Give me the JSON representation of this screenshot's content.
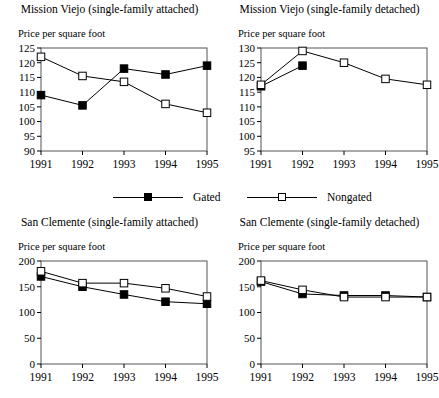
{
  "legend": {
    "gated_label": "Gated",
    "nongated_label": "Nongated",
    "gated_marker": "filled-square-marker",
    "nongated_marker": "open-square-marker"
  },
  "panels": [
    {
      "id": "mission-viejo-attached",
      "title": "Mission Viejo (single-family attached)",
      "ylabel": "Price per square foot"
    },
    {
      "id": "mission-viejo-detached",
      "title": "Mission Viejo (single-family detached)",
      "ylabel": "Price per square foot"
    },
    {
      "id": "san-clemente-attached",
      "title": "San Clemente (single-family attached)",
      "ylabel": "Price per square foot"
    },
    {
      "id": "san-clemente-detached",
      "title": "San Clemente (single-family detached)",
      "ylabel": "Price per square foot"
    }
  ],
  "chart_data": [
    {
      "type": "line",
      "title": "Mission Viejo (single-family attached)",
      "xlabel": "",
      "ylabel": "Price per square foot",
      "categories": [
        "1991",
        "1992",
        "1993",
        "1994",
        "1995"
      ],
      "x": [
        1991,
        1992,
        1993,
        1994,
        1995
      ],
      "ylim": [
        90,
        125
      ],
      "yticks": [
        90,
        95,
        100,
        105,
        110,
        115,
        120,
        125
      ],
      "grid": false,
      "legend_position": "below-figure",
      "series": [
        {
          "name": "Gated",
          "marker": "filled-square",
          "values": [
            109,
            105.5,
            118,
            116,
            119
          ]
        },
        {
          "name": "Nongated",
          "marker": "open-square",
          "values": [
            122,
            115.5,
            113.5,
            106,
            103
          ]
        }
      ]
    },
    {
      "type": "line",
      "title": "Mission Viejo (single-family detached)",
      "xlabel": "",
      "ylabel": "Price per square foot",
      "categories": [
        "1991",
        "1992",
        "1993",
        "1994",
        "1995"
      ],
      "x": [
        1991,
        1992,
        1993,
        1994,
        1995
      ],
      "ylim": [
        95,
        130
      ],
      "yticks": [
        95,
        100,
        105,
        110,
        115,
        120,
        125,
        130
      ],
      "grid": false,
      "legend_position": "below-figure",
      "series": [
        {
          "name": "Gated",
          "marker": "filled-square",
          "values": [
            117,
            124,
            null,
            null,
            null
          ]
        },
        {
          "name": "Nongated",
          "marker": "open-square",
          "values": [
            117.5,
            129,
            125,
            119.5,
            117.5
          ]
        }
      ]
    },
    {
      "type": "line",
      "title": "San Clemente (single-family attached)",
      "xlabel": "",
      "ylabel": "Price per square foot",
      "categories": [
        "1991",
        "1992",
        "1993",
        "1994",
        "1995"
      ],
      "x": [
        1991,
        1992,
        1993,
        1994,
        1995
      ],
      "ylim": [
        0,
        200
      ],
      "yticks": [
        0,
        50,
        100,
        150,
        200
      ],
      "grid": false,
      "legend_position": "below-figure",
      "series": [
        {
          "name": "Gated",
          "marker": "filled-square",
          "values": [
            170,
            150,
            135,
            121,
            117
          ]
        },
        {
          "name": "Nongated",
          "marker": "open-square",
          "values": [
            180,
            157,
            157,
            147,
            131
          ]
        }
      ]
    },
    {
      "type": "line",
      "title": "San Clemente (single-family detached)",
      "xlabel": "",
      "ylabel": "Price per square foot",
      "categories": [
        "1991",
        "1992",
        "1993",
        "1994",
        "1995"
      ],
      "x": [
        1991,
        1992,
        1993,
        1994,
        1995
      ],
      "ylim": [
        0,
        200
      ],
      "yticks": [
        0,
        50,
        100,
        150,
        200
      ],
      "grid": false,
      "legend_position": "below-figure",
      "series": [
        {
          "name": "Gated",
          "marker": "filled-square",
          "values": [
            160,
            136,
            133,
            133,
            130
          ]
        },
        {
          "name": "Nongated",
          "marker": "open-square",
          "values": [
            162,
            144,
            130,
            130,
            130
          ]
        }
      ]
    }
  ]
}
